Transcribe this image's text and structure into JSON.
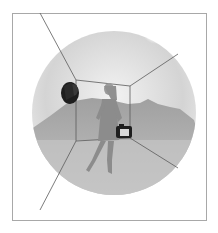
{
  "illustration": {
    "subject": "woman holding camera inside wireframe room over circular landscape",
    "elements": [
      "frame",
      "sky-circle",
      "sun",
      "mountains",
      "room-wireframe",
      "woman-figure",
      "camera",
      "speaker-object"
    ],
    "colors": {
      "background": "#ffffff",
      "frame": "#9a9a9a",
      "circle_light": "#f4f4f4",
      "circle_dark": "#c8c8c8",
      "mountain": "#a8a8a8",
      "line": "#5a5a5a",
      "figure": "#8c8c8c",
      "object_dark": "#1e1e1e"
    }
  }
}
